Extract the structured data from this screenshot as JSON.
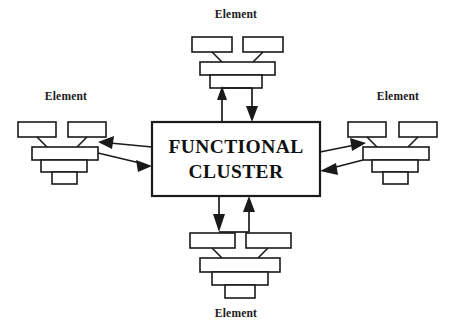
{
  "diagram": {
    "title_text": "FUNCTIONAL CLUSTER",
    "cluster": {
      "line1": "FUNCTIONAL",
      "line2": "CLUSTER",
      "x": 152,
      "y": 122,
      "width": 168,
      "height": 74,
      "stroke": "#1a1a1a",
      "fill": "#ffffff"
    },
    "elements": [
      {
        "id": "top",
        "label": "Element",
        "label_x": 236,
        "label_y": 18,
        "orientation": "down",
        "position": "top"
      },
      {
        "id": "left",
        "label": "Element",
        "label_x": 66,
        "label_y": 100,
        "orientation": "down",
        "position": "left"
      },
      {
        "id": "right",
        "label": "Element",
        "label_x": 398,
        "label_y": 100,
        "orientation": "down",
        "position": "right"
      },
      {
        "id": "bottom",
        "label": "Element",
        "label_x": 236,
        "label_y": 317,
        "orientation": "up",
        "position": "bottom"
      }
    ],
    "connections": [
      {
        "id": "top-in",
        "from": "cluster",
        "to": "top-element",
        "direction": "up"
      },
      {
        "id": "top-out",
        "from": "top-element",
        "to": "cluster",
        "direction": "down"
      },
      {
        "id": "left-in",
        "from": "cluster",
        "to": "left-element",
        "direction": "left"
      },
      {
        "id": "left-out",
        "from": "left-element",
        "to": "cluster",
        "direction": "right"
      },
      {
        "id": "right-in",
        "from": "cluster",
        "to": "right-element",
        "direction": "right"
      },
      {
        "id": "right-out",
        "from": "right-element",
        "to": "cluster",
        "direction": "left"
      },
      {
        "id": "bottom-in",
        "from": "cluster",
        "to": "bottom-element",
        "direction": "down"
      },
      {
        "id": "bottom-out",
        "from": "bottom-element",
        "to": "cluster",
        "direction": "up"
      }
    ],
    "colors": {
      "stroke": "#1a1a1a",
      "fill": "#ffffff",
      "background": "#ffffff"
    }
  }
}
